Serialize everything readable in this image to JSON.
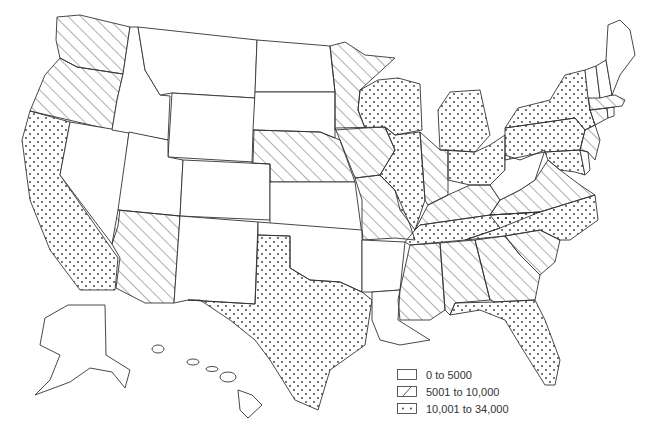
{
  "map": {
    "type": "choropleth",
    "region": "United States",
    "categories": [
      {
        "id": "low",
        "label": "0 to 5000",
        "pattern": "blank"
      },
      {
        "id": "mid",
        "label": "5001 to 10,000",
        "pattern": "hatched"
      },
      {
        "id": "high",
        "label": "10,001 to 34,000",
        "pattern": "dotted"
      }
    ],
    "states": {
      "WA": "mid",
      "OR": "mid",
      "CA": "high",
      "ID": "low",
      "NV": "low",
      "MT": "low",
      "WY": "low",
      "UT": "low",
      "AZ": "mid",
      "CO": "low",
      "NM": "low",
      "ND": "low",
      "SD": "low",
      "NE": "mid",
      "KS": "low",
      "OK": "low",
      "TX": "high",
      "MN": "mid",
      "IA": "mid",
      "MO": "mid",
      "AR": "low",
      "LA": "low",
      "WI": "high",
      "IL": "high",
      "MI": "high",
      "IN": "mid",
      "OH": "high",
      "KY": "mid",
      "TN": "high",
      "MS": "mid",
      "AL": "mid",
      "GA": "mid",
      "FL": "high",
      "SC": "mid",
      "NC": "high",
      "VA": "mid",
      "WV": "low",
      "PA": "high",
      "NY": "high",
      "MD": "high",
      "DE": "low",
      "NJ": "mid",
      "CT": "mid",
      "RI": "low",
      "MA": "mid",
      "VT": "low",
      "NH": "low",
      "ME": "low",
      "AK": "low",
      "HI": "low"
    }
  },
  "legend": {
    "items": [
      {
        "label": "0 to 5000"
      },
      {
        "label": "5001 to 10,000"
      },
      {
        "label": "10,001 to 34,000"
      }
    ]
  }
}
